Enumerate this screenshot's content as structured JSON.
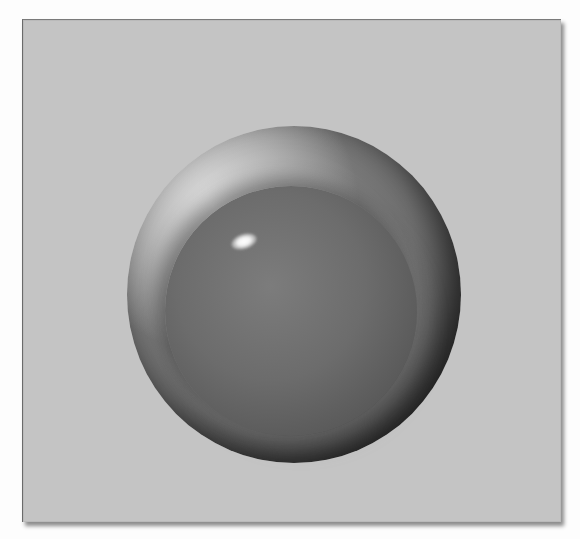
{
  "scene": {
    "description": "Shaded 3D dome/sphere rendering on a gray background panel",
    "colors": {
      "page_background": "#fdfdfd",
      "panel_background": "#c4c4c4",
      "sphere_light": "#e6e6e6",
      "sphere_dark": "#1a1a1a",
      "dome_mid": "#6c6c6c",
      "highlight": "#ffffff"
    }
  }
}
